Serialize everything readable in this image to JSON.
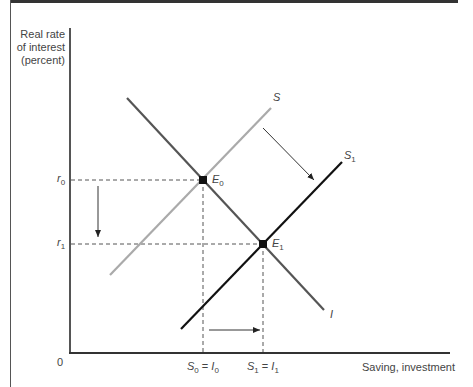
{
  "axes": {
    "y_label_lines": [
      "Real rate",
      "of interest",
      "(percent)"
    ],
    "x_label": "Saving, investment",
    "origin": "0"
  },
  "ticks": {
    "r0": {
      "base": "r",
      "sub": "0"
    },
    "r1": {
      "base": "r",
      "sub": "1"
    },
    "x0": {
      "left": "S",
      "left_sub": "0",
      "eq": " = ",
      "right": "I",
      "right_sub": "0"
    },
    "x1": {
      "left": "S",
      "left_sub": "1",
      "eq": " = ",
      "right": "I",
      "right_sub": "1"
    }
  },
  "curves": {
    "S": {
      "label": "S",
      "color": "#aaaaaa"
    },
    "S1": {
      "label": "S",
      "sub": "1",
      "color": "#111111"
    },
    "I": {
      "label": "I",
      "color": "#555555"
    }
  },
  "points": {
    "E0": {
      "base": "E",
      "sub": "0"
    },
    "E1": {
      "base": "E",
      "sub": "1"
    }
  }
}
